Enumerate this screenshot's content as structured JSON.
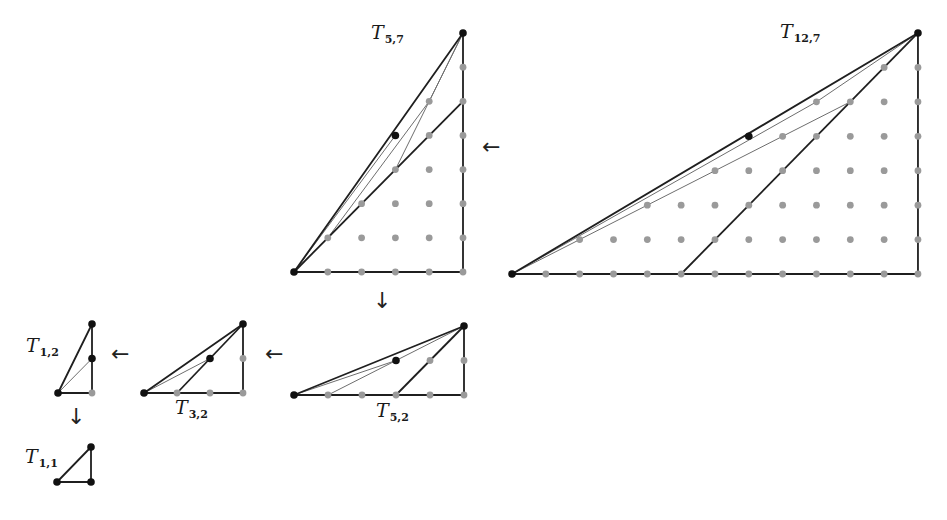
{
  "figure": {
    "colors": {
      "line": "#1f1f1f",
      "thin_line": "#6e6e6e",
      "gray_dot": "#9a9a9a",
      "black_dot": "#111111",
      "background": "#ffffff"
    },
    "unit_px": 34.0,
    "triangles": [
      {
        "id": "T12_7",
        "label_main": "T",
        "label_sub": "12,7",
        "a": 12,
        "b": 7,
        "origin": [
          512,
          274
        ],
        "unit": [
          33.83,
          34.43
        ],
        "label_pos": [
          780,
          22
        ],
        "special_point": [
          7,
          4
        ],
        "thick_extra": [
          [
            [
              5,
              0
            ],
            [
              12,
              7
            ]
          ]
        ],
        "thin_lines": [
          [
            [
              0,
              0
            ],
            [
              9,
              5
            ],
            [
              12,
              7
            ]
          ],
          [
            [
              0,
              0
            ],
            [
              10,
              5
            ]
          ]
        ],
        "show_interior": true
      },
      {
        "id": "T5_7",
        "label_main": "T",
        "label_sub": "5,7",
        "a": 5,
        "b": 7,
        "origin": [
          294,
          272
        ],
        "unit": [
          33.8,
          34.14
        ],
        "label_pos": [
          371,
          23
        ],
        "special_point": [
          3,
          4
        ],
        "thick_extra": [
          [
            [
              0,
              0
            ],
            [
              5,
              5
            ]
          ]
        ],
        "thin_lines": [
          [
            [
              1,
              1
            ],
            [
              4,
              5
            ],
            [
              5,
              7
            ]
          ],
          [
            [
              5,
              7
            ],
            [
              3,
              3
            ]
          ],
          [
            [
              0,
              0
            ],
            [
              3,
              4
            ]
          ]
        ],
        "show_interior": true
      },
      {
        "id": "T5_2",
        "label_main": "T",
        "label_sub": "5,2",
        "a": 5,
        "b": 2,
        "origin": [
          294,
          395
        ],
        "unit": [
          34.0,
          34.5
        ],
        "label_pos": [
          376,
          401
        ],
        "special_point": [
          3,
          1
        ],
        "thick_extra": [
          [
            [
              3,
              0
            ],
            [
              5,
              2
            ]
          ]
        ],
        "thin_lines": [
          [
            [
              1,
              0
            ],
            [
              3,
              1
            ],
            [
              5,
              2
            ]
          ],
          [
            [
              0,
              0
            ],
            [
              3,
              1
            ]
          ]
        ],
        "show_interior": true
      },
      {
        "id": "T3_2",
        "label_main": "T",
        "label_sub": "3,2",
        "a": 3,
        "b": 2,
        "origin": [
          144,
          393
        ],
        "unit": [
          33.0,
          34.5
        ],
        "label_pos": [
          175,
          398
        ],
        "special_point": [
          2,
          1
        ],
        "thick_extra": [
          [
            [
              1,
              0
            ],
            [
              3,
              2
            ]
          ]
        ],
        "thin_lines": [
          [
            [
              0,
              0
            ],
            [
              2,
              1
            ]
          ]
        ],
        "show_interior": true
      },
      {
        "id": "T1_2",
        "label_main": "T",
        "label_sub": "1,2",
        "a": 1,
        "b": 2,
        "origin": [
          58,
          393
        ],
        "unit": [
          34.0,
          34.5
        ],
        "label_pos": [
          26,
          336
        ],
        "special_point": [
          1,
          1
        ],
        "thick_extra": [],
        "thin_lines": [
          [
            [
              0,
              0
            ],
            [
              1,
              1
            ]
          ]
        ],
        "show_interior": true
      },
      {
        "id": "T1_1",
        "label_main": "T",
        "label_sub": "1,1",
        "a": 1,
        "b": 1,
        "origin": [
          57,
          482
        ],
        "unit": [
          34.0,
          35.0
        ],
        "label_pos": [
          25,
          447
        ],
        "special_point": null,
        "corner_black": true,
        "thick_extra": [],
        "thin_lines": [],
        "show_interior": false
      }
    ],
    "arrows": [
      {
        "id": "arrow-t12-to-t5-7",
        "glyph": "←",
        "pos": [
          482,
          136
        ]
      },
      {
        "id": "arrow-t5-7-to-t5-2",
        "glyph": "↓",
        "pos": [
          373,
          290
        ]
      },
      {
        "id": "arrow-t5-2-to-t3-2",
        "glyph": "←",
        "pos": [
          265,
          343
        ]
      },
      {
        "id": "arrow-t3-2-to-t1-2",
        "glyph": "←",
        "pos": [
          111,
          343
        ]
      },
      {
        "id": "arrow-t1-2-to-t1-1",
        "glyph": "↓",
        "pos": [
          67,
          406
        ]
      }
    ]
  }
}
